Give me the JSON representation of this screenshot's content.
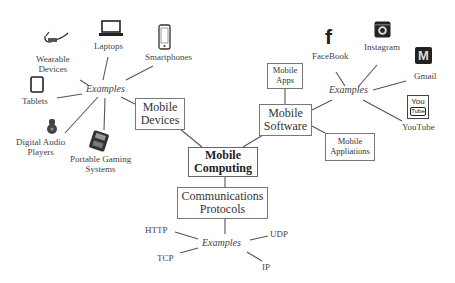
{
  "diagram": {
    "central": {
      "line1": "Mobile",
      "line2": "Computing"
    },
    "branches": {
      "devices": {
        "box": {
          "line1": "Mobile",
          "line2": "Devices"
        },
        "examples_label": "Examples",
        "examples": [
          {
            "name": "Wearable Devices",
            "line1": "Wearable",
            "line2": "Devices",
            "icon": "smart-glasses-icon"
          },
          {
            "name": "Laptops",
            "line1": "Laptops",
            "icon": "laptop-icon"
          },
          {
            "name": "Smartphones",
            "line1": "Smartphones",
            "icon": "smartphone-icon"
          },
          {
            "name": "Tablets",
            "line1": "Tablets",
            "icon": "tablet-icon"
          },
          {
            "name": "Digital Audio Players",
            "line1": "Digital Audio",
            "line2": "Players",
            "icon": "audio-player-icon"
          },
          {
            "name": "Portable Gaming Systems",
            "line1": "Portable Gaming",
            "line2": "Systems",
            "icon": "gaming-console-icon"
          }
        ]
      },
      "software": {
        "box": {
          "line1": "Mobile",
          "line2": "Software"
        },
        "children": [
          {
            "line1": "Mobile",
            "line2": "Apps"
          },
          {
            "line1": "Mobile",
            "line2": "Appliations"
          }
        ],
        "examples_label": "Examples",
        "examples": [
          {
            "name": "FaceBook",
            "icon": "facebook-icon",
            "glyph": "f"
          },
          {
            "name": "Instagram",
            "icon": "instagram-icon"
          },
          {
            "name": "Gmail",
            "icon": "gmail-icon",
            "glyph": "M"
          },
          {
            "name": "YouTube",
            "icon": "youtube-icon",
            "glyph_top": "You",
            "glyph_bottom": "Tube"
          }
        ]
      },
      "protocols": {
        "box": {
          "line1": "Communications",
          "line2": "Protocols"
        },
        "examples_label": "Examples",
        "examples": [
          {
            "name": "HTTP"
          },
          {
            "name": "UDP"
          },
          {
            "name": "TCP"
          },
          {
            "name": "IP"
          }
        ]
      }
    },
    "colors": {
      "line": "#555555",
      "box_border": "#777777",
      "text": "#333333",
      "icon": "#222222"
    }
  }
}
